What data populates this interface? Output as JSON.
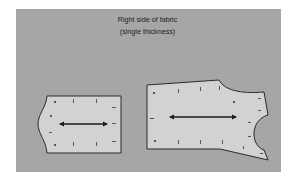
{
  "figure": {
    "caption_line1": "Right side of fabric",
    "caption_line2": "(single thickness)",
    "colors": {
      "background": "#ffffff",
      "fabric": "#a6a6a6",
      "pattern_piece": "#d2d2d2",
      "outline": "#2a2a2a"
    },
    "pieces": [
      {
        "name": "small-pattern-piece",
        "grainline": "horizontal double-headed arrow"
      },
      {
        "name": "large-pattern-piece",
        "grainline": "horizontal double-headed arrow"
      }
    ]
  }
}
